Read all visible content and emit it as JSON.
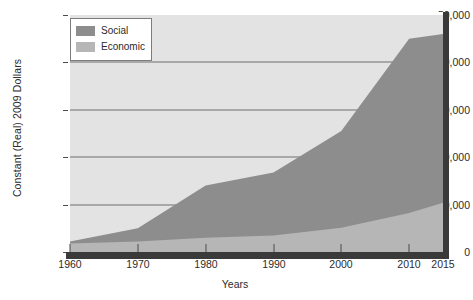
{
  "chart_data": {
    "type": "area",
    "title": "",
    "subtitle": "",
    "xlabel": "Years",
    "ylabel": "Constant (Real) 2009 Dollars",
    "stacked": true,
    "grid": true,
    "legend_position": "top-left",
    "xlim": [
      1960,
      2015
    ],
    "ylim": [
      0,
      50000
    ],
    "x": [
      1960,
      1970,
      1980,
      1990,
      2000,
      2010,
      2015
    ],
    "xticks": [
      1960,
      1970,
      1980,
      1990,
      2000,
      2010,
      2015
    ],
    "xtick_labels": [
      "1960",
      "1970",
      "1980",
      "1990",
      "2000",
      "2010",
      "2015"
    ],
    "yticks": [
      0,
      10000,
      20000,
      30000,
      40000,
      50000
    ],
    "ytick_labels": [
      "0",
      "10,000",
      "20,000",
      "30,000",
      "40,000",
      "50,000"
    ],
    "series": [
      {
        "name": "Economic",
        "color": "#b6b6b6",
        "values": [
          1800,
          2200,
          3000,
          3500,
          5100,
          8200,
          10400
        ]
      },
      {
        "name": "Social",
        "color": "#8d8d8d",
        "values": [
          400,
          2800,
          11000,
          13300,
          20400,
          36800,
          35600
        ]
      }
    ],
    "stack_tops": {
      "Economic": [
        1800,
        2200,
        3000,
        3500,
        5100,
        8200,
        10400
      ],
      "Social": [
        2200,
        5000,
        14000,
        16800,
        25500,
        45000,
        46000
      ]
    }
  },
  "legend": {
    "items": [
      {
        "label": "Social",
        "color": "#8d8d8d"
      },
      {
        "label": "Economic",
        "color": "#b6b6b6"
      }
    ]
  },
  "style": {
    "plot_background": "#e3e3e3",
    "gridline_color": "#6f6f6f",
    "axis_color": "#3a3a3a",
    "text_color": "#2b2b2b"
  }
}
